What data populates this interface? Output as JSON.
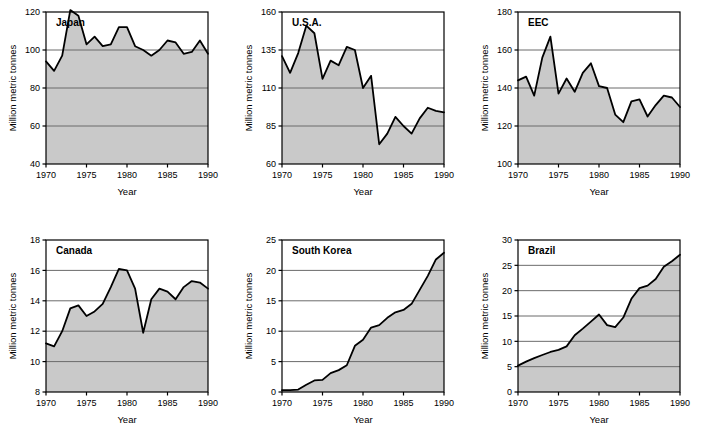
{
  "figure": {
    "panel_count": 6,
    "axis_titles": {
      "x": "Year",
      "y": "Million metric tonnes"
    }
  },
  "chart_data": [
    {
      "type": "area",
      "title": "Japan",
      "xlabel": "Year",
      "ylabel": "Million metric tonnes",
      "xlim": [
        1970,
        1990
      ],
      "ylim": [
        40,
        120
      ],
      "xticks": [
        1970,
        1975,
        1980,
        1985,
        1990
      ],
      "yticks": [
        40,
        60,
        80,
        100,
        120
      ],
      "grid": true,
      "legend": "none",
      "x": [
        1970,
        1971,
        1972,
        1973,
        1974,
        1975,
        1976,
        1977,
        1978,
        1979,
        1980,
        1981,
        1982,
        1983,
        1984,
        1985,
        1986,
        1987,
        1988,
        1989,
        1990
      ],
      "values": [
        94,
        89,
        97,
        121,
        118,
        103,
        107,
        102,
        103,
        112,
        112,
        102,
        100,
        97,
        100,
        105,
        104,
        98,
        99,
        105,
        98
      ]
    },
    {
      "type": "area",
      "title": "U.S.A.",
      "xlabel": "Year",
      "ylabel": "Million metric tonnes",
      "xlim": [
        1970,
        1990
      ],
      "ylim": [
        60,
        160
      ],
      "xticks": [
        1970,
        1975,
        1980,
        1985,
        1990
      ],
      "yticks": [
        60,
        85,
        110,
        135,
        160
      ],
      "grid": true,
      "legend": "none",
      "x": [
        1970,
        1971,
        1972,
        1973,
        1974,
        1975,
        1976,
        1977,
        1978,
        1979,
        1980,
        1981,
        1982,
        1983,
        1984,
        1985,
        1986,
        1987,
        1988,
        1989,
        1990
      ],
      "values": [
        131,
        120,
        133,
        151,
        146,
        116,
        128,
        125,
        137,
        135,
        110,
        118,
        73,
        80,
        91,
        85,
        80,
        90,
        97,
        95,
        94
      ]
    },
    {
      "type": "area",
      "title": "EEC",
      "xlabel": "Year",
      "ylabel": "Million metric tonnes",
      "xlim": [
        1970,
        1990
      ],
      "ylim": [
        100,
        180
      ],
      "xticks": [
        1970,
        1975,
        1980,
        1985,
        1990
      ],
      "yticks": [
        100,
        120,
        140,
        160,
        180
      ],
      "grid": true,
      "legend": "none",
      "x": [
        1970,
        1971,
        1972,
        1973,
        1974,
        1975,
        1976,
        1977,
        1978,
        1979,
        1980,
        1981,
        1982,
        1983,
        1984,
        1985,
        1986,
        1987,
        1988,
        1989,
        1990
      ],
      "values": [
        144,
        146,
        136,
        156,
        167,
        137,
        145,
        138,
        148,
        153,
        141,
        140,
        126,
        122,
        133,
        134,
        125,
        131,
        136,
        135,
        130
      ]
    },
    {
      "type": "area",
      "title": "Canada",
      "xlabel": "Year",
      "ylabel": "Million metric tonnes",
      "xlim": [
        1970,
        1990
      ],
      "ylim": [
        8,
        18
      ],
      "xticks": [
        1970,
        1975,
        1980,
        1985,
        1990
      ],
      "yticks": [
        8,
        10,
        12,
        14,
        16,
        18
      ],
      "grid": true,
      "legend": "none",
      "x": [
        1970,
        1971,
        1972,
        1973,
        1974,
        1975,
        1976,
        1977,
        1978,
        1979,
        1980,
        1981,
        1982,
        1983,
        1984,
        1985,
        1986,
        1987,
        1988,
        1989,
        1990
      ],
      "values": [
        11.2,
        11.0,
        12.0,
        13.5,
        13.7,
        13.0,
        13.3,
        13.8,
        14.9,
        16.1,
        16.0,
        14.8,
        11.9,
        14.1,
        14.8,
        14.6,
        14.1,
        14.9,
        15.3,
        15.2,
        14.8
      ]
    },
    {
      "type": "area",
      "title": "South Korea",
      "xlabel": "Year",
      "ylabel": "Million metric tonnes",
      "xlim": [
        1970,
        1990
      ],
      "ylim": [
        0,
        25
      ],
      "xticks": [
        1970,
        1975,
        1980,
        1985,
        1990
      ],
      "yticks": [
        0,
        5,
        10,
        15,
        20,
        25
      ],
      "grid": true,
      "legend": "none",
      "x": [
        1970,
        1971,
        1972,
        1973,
        1974,
        1975,
        1976,
        1977,
        1978,
        1979,
        1980,
        1981,
        1982,
        1983,
        1984,
        1985,
        1986,
        1987,
        1988,
        1989,
        1990
      ],
      "values": [
        0.3,
        0.3,
        0.4,
        1.2,
        1.9,
        2.0,
        3.1,
        3.6,
        4.4,
        7.6,
        8.6,
        10.6,
        11.0,
        12.2,
        13.1,
        13.5,
        14.5,
        16.8,
        19.1,
        21.8,
        22.9
      ]
    },
    {
      "type": "area",
      "title": "Brazil",
      "xlabel": "Year",
      "ylabel": "Million metric tonnes",
      "xlim": [
        1970,
        1990
      ],
      "ylim": [
        0,
        30
      ],
      "xticks": [
        1970,
        1975,
        1980,
        1985,
        1990
      ],
      "yticks": [
        0,
        5,
        10,
        15,
        20,
        25,
        30
      ],
      "grid": true,
      "legend": "none",
      "x": [
        1970,
        1971,
        1972,
        1973,
        1974,
        1975,
        1976,
        1977,
        1978,
        1979,
        1980,
        1981,
        1982,
        1983,
        1984,
        1985,
        1986,
        1987,
        1988,
        1989,
        1990
      ],
      "values": [
        5.2,
        6.0,
        6.7,
        7.3,
        7.9,
        8.3,
        9.0,
        11.2,
        12.5,
        13.9,
        15.3,
        13.2,
        12.8,
        14.7,
        18.4,
        20.5,
        21.0,
        22.3,
        24.7,
        25.8,
        27.1
      ]
    }
  ],
  "panels": [
    {
      "title": "Japan",
      "xlabel": "Year",
      "ylabel": "Million metric tonnes"
    },
    {
      "title": "U.S.A.",
      "xlabel": "Year",
      "ylabel": "Million metric tonnes"
    },
    {
      "title": "EEC",
      "xlabel": "Year",
      "ylabel": "Million metric tonnes"
    },
    {
      "title": "Canada",
      "xlabel": "Year",
      "ylabel": "Million metric tonnes"
    },
    {
      "title": "South Korea",
      "xlabel": "Year",
      "ylabel": "Million metric tonnes"
    },
    {
      "title": "Brazil",
      "xlabel": "Year",
      "ylabel": "Million metric tonnes"
    }
  ],
  "colors": {
    "fill": "#c9c9c9",
    "line": "#000000",
    "grid": "#6b6b6b",
    "frame": "#000000",
    "background": "#ffffff"
  }
}
